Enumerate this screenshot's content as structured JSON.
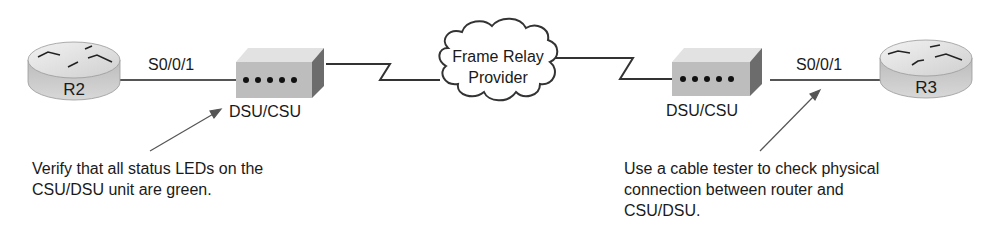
{
  "diagram": {
    "routers": [
      {
        "id": "r2",
        "label": "R2"
      },
      {
        "id": "r3",
        "label": "R3"
      }
    ],
    "interfaces": [
      {
        "router": "R2",
        "label": "S0/0/1"
      },
      {
        "router": "R3",
        "label": "S0/0/1"
      }
    ],
    "dsu_csu": [
      {
        "label": "DSU/CSU",
        "led_count": 5
      },
      {
        "label": "DSU/CSU",
        "led_count": 5
      }
    ],
    "cloud": {
      "line1": "Frame Relay",
      "line2": "Provider"
    },
    "notes": {
      "left": {
        "line1": "Verify that all status LEDs on the",
        "line2": "CSU/DSU unit are green."
      },
      "right": {
        "line1": "Use a cable tester to check physical",
        "line2": "connection between router and",
        "line3": "CSU/DSU."
      }
    },
    "colors": {
      "line": "#555555",
      "device_top": "#e4e4e4",
      "device_front": "#bdbdbd",
      "device_side": "#6e6e6e",
      "led": "#111111"
    }
  }
}
